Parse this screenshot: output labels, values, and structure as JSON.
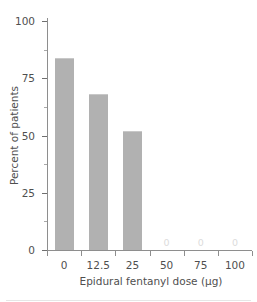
{
  "chart_data": {
    "type": "bar",
    "title": "",
    "subtitle": "",
    "xlabel": "Epidural fentanyl dose (µg)",
    "ylabel": "Percent of patients",
    "categories": [
      "0",
      "12.5",
      "25",
      "50",
      "75",
      "100"
    ],
    "values": [
      84,
      68,
      52,
      0,
      0,
      0
    ],
    "bar_value_labels": [
      "",
      "",
      "",
      "0",
      "0",
      "0"
    ],
    "ylim": [
      0,
      100
    ],
    "yticks": [
      0,
      25,
      50,
      75,
      100
    ],
    "ytick_labels": [
      "0",
      "25",
      "50",
      "75",
      "100"
    ],
    "yminor_ticks": [
      12.5,
      37.5,
      62.5,
      87.5
    ],
    "grid": false,
    "legend": null,
    "legend_position": "none",
    "bar_color": "#b1b1b1",
    "axis_color": "#8e8e8e",
    "text_color": "#4f4f4f",
    "zero_label_color": "#dcdcdc",
    "background": "#ffffff"
  }
}
